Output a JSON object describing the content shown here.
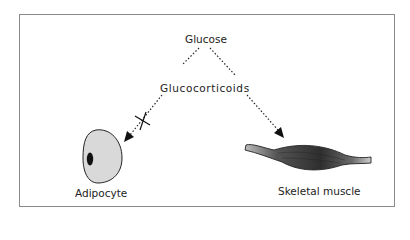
{
  "diagram": {
    "nodes": {
      "glucose": "Glucose",
      "glucocorticoids": "Glucocorticoids",
      "adipocyte": "Adipocyte",
      "skeletal_muscle": "Skeletal muscle"
    },
    "edges": [
      {
        "from": "Glucose",
        "to": "Adipocyte",
        "style": "dotted",
        "blocked": true,
        "via": "Glucocorticoids"
      },
      {
        "from": "Glucose",
        "to": "Skeletal muscle",
        "style": "dotted",
        "blocked": false,
        "via": "Glucocorticoids"
      }
    ],
    "colors": {
      "border": "#8a8a8a",
      "adipocyte_fill": "#d9d9d9",
      "nucleus": "#111111",
      "muscle": "#3a3a3a",
      "line": "#222222"
    }
  }
}
